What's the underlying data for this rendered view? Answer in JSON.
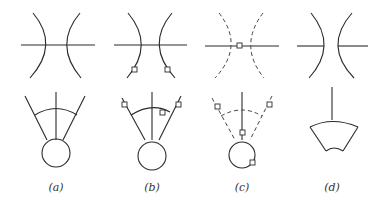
{
  "figure": {
    "panels": [
      {
        "id": "a",
        "caption": "(a)"
      },
      {
        "id": "b",
        "caption": "(b)"
      },
      {
        "id": "c",
        "caption": "(c)"
      },
      {
        "id": "d",
        "caption": "(d)"
      }
    ]
  }
}
